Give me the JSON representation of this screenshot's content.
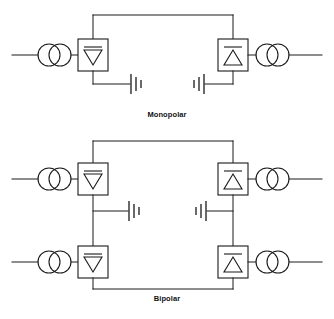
{
  "figure": {
    "background_color": "#ffffff",
    "line_color": "#1a1a1a"
  },
  "diagrams": [
    {
      "id": "monopolar",
      "caption": "Monopolar",
      "description": "Single-pole HVDC link with ground return",
      "poles": 1,
      "ground_returns": 2,
      "terminals": [
        {
          "side": "left",
          "role": "rectifier",
          "ac_line_label": "AC system",
          "transformer": "converter-transformer",
          "converter_symbol": "thyristor-valve-down"
        },
        {
          "side": "right",
          "role": "inverter",
          "ac_line_label": "AC system",
          "transformer": "converter-transformer",
          "converter_symbol": "thyristor-valve-up"
        }
      ]
    },
    {
      "id": "bipolar",
      "caption": "Bipolar",
      "description": "Two-pole HVDC link with grounded neutral at each station",
      "poles": 2,
      "ground_returns": 2,
      "terminals": [
        {
          "side": "left",
          "role": "rectifier",
          "ac_line_label": "AC system",
          "transformer": "converter-transformer",
          "converter_symbol": "thyristor-valve-down"
        },
        {
          "side": "right",
          "role": "inverter",
          "ac_line_label": "AC system",
          "transformer": "converter-transformer",
          "converter_symbol": "thyristor-valve-up"
        },
        {
          "side": "left",
          "role": "rectifier",
          "ac_line_label": "AC system",
          "transformer": "converter-transformer",
          "converter_symbol": "thyristor-valve-down"
        },
        {
          "side": "right",
          "role": "inverter",
          "ac_line_label": "AC system",
          "transformer": "converter-transformer",
          "converter_symbol": "thyristor-valve-up"
        }
      ]
    }
  ],
  "symbols": {
    "transformer": "two-overlapping-circles",
    "converter": "square-with-triangle-and-bar",
    "ground": "three-descending-vertical-bars"
  }
}
